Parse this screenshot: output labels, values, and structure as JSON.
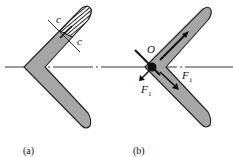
{
  "figure": {
    "panels": [
      {
        "id": "a",
        "caption": "(a)",
        "section_label_1": "c",
        "section_label_2": "c"
      },
      {
        "id": "b",
        "caption": "(b)",
        "point_label": "O",
        "force_label_1": "F",
        "force_label_1_sub": "1",
        "force_label_2": "F",
        "force_label_2_sub": "1"
      }
    ],
    "colors": {
      "body_fill": "#a6a6a6",
      "outline": "#222222",
      "hatch": "#111111",
      "axis": "#222222"
    }
  }
}
